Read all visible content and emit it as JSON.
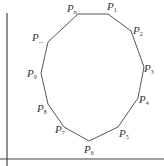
{
  "diagram": {
    "type": "polygon",
    "colors": {
      "stroke": "#555555",
      "axis": "#444444",
      "text": "#333333",
      "background": "#ffffff"
    },
    "axes": {
      "vertical": {
        "x": 7,
        "y1": 13,
        "y2": 166
      },
      "horizontal": {
        "y": 159,
        "x1": 0,
        "x2": 164
      }
    },
    "vertices": [
      {
        "name": "Pn",
        "base": "P",
        "sub": "n",
        "x": 78,
        "y": 14
      },
      {
        "name": "P1",
        "base": "P",
        "sub": "1",
        "x": 108,
        "y": 14
      },
      {
        "name": "P2",
        "base": "P",
        "sub": "2",
        "x": 131,
        "y": 31
      },
      {
        "name": "P3",
        "base": "P",
        "sub": "3",
        "x": 144,
        "y": 67
      },
      {
        "name": "P4",
        "base": "P",
        "sub": "4",
        "x": 138,
        "y": 98
      },
      {
        "name": "P5",
        "base": "P",
        "sub": "5",
        "x": 118,
        "y": 127
      },
      {
        "name": "P6",
        "base": "P",
        "sub": "6",
        "x": 89,
        "y": 141
      },
      {
        "name": "P7",
        "base": "P",
        "sub": "7",
        "x": 64,
        "y": 127
      },
      {
        "name": "P8",
        "base": "P",
        "sub": "8",
        "x": 48,
        "y": 104
      },
      {
        "name": "P9",
        "base": "P",
        "sub": "9",
        "x": 41,
        "y": 73
      },
      {
        "name": "P...",
        "base": "P",
        "sub": "...",
        "x": 48,
        "y": 42
      }
    ],
    "labels": [
      {
        "text": "P",
        "sub": "n",
        "x": 67,
        "y": 12
      },
      {
        "text": "P",
        "sub": "1",
        "x": 107,
        "y": 10
      },
      {
        "text": "P",
        "sub": "2",
        "x": 133,
        "y": 34
      },
      {
        "text": "P",
        "sub": "3",
        "x": 144,
        "y": 72
      },
      {
        "text": "P",
        "sub": "4",
        "x": 139,
        "y": 103
      },
      {
        "text": "P",
        "sub": "5",
        "x": 119,
        "y": 137
      },
      {
        "text": "P",
        "sub": "6",
        "x": 84,
        "y": 153
      },
      {
        "text": "P",
        "sub": "7",
        "x": 55,
        "y": 133
      },
      {
        "text": "P",
        "sub": "8",
        "x": 37,
        "y": 112
      },
      {
        "text": "P",
        "sub": "9",
        "x": 27,
        "y": 77
      },
      {
        "text": "P",
        "sub": "...",
        "x": 32,
        "y": 41
      }
    ]
  }
}
